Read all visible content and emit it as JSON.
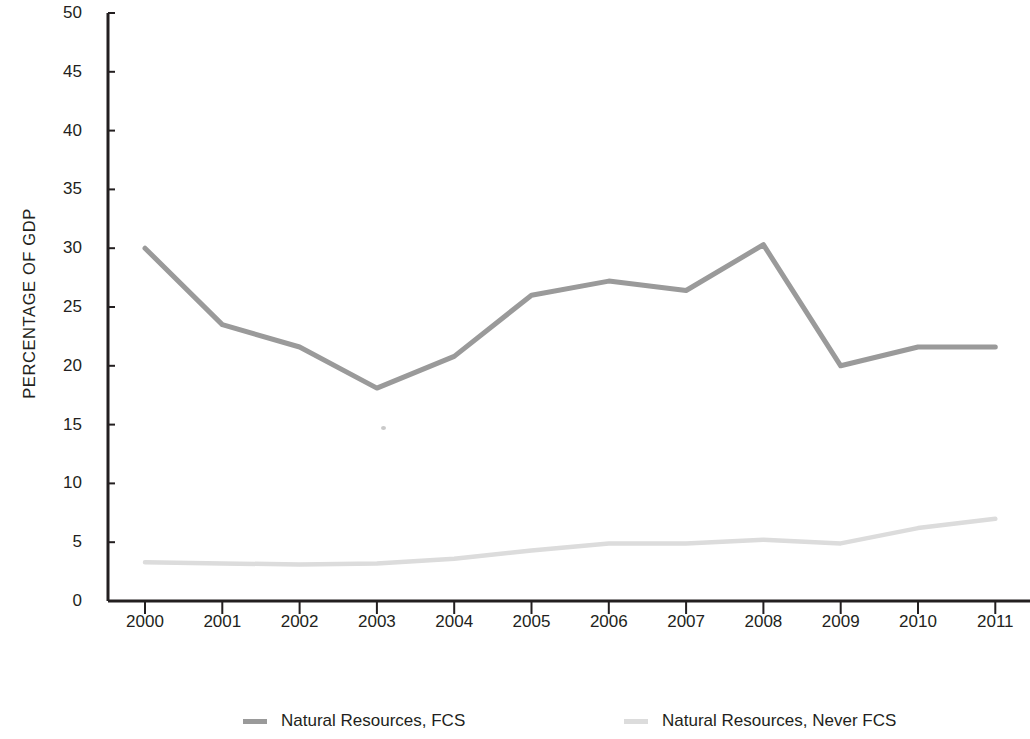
{
  "chart_data": {
    "type": "line",
    "title": "",
    "subtitle": "",
    "xlabel": "",
    "ylabel": "PERCENTAGE OF GDP",
    "categories": [
      "2000",
      "2001",
      "2002",
      "2003",
      "2004",
      "2005",
      "2006",
      "2007",
      "2008",
      "2009",
      "2010",
      "2011"
    ],
    "x": [
      2000,
      2001,
      2002,
      2003,
      2004,
      2005,
      2006,
      2007,
      2008,
      2009,
      2010,
      2011
    ],
    "xlim": [
      2000,
      2011
    ],
    "ylim": [
      0,
      50
    ],
    "y_ticks": [
      0,
      5,
      10,
      15,
      20,
      25,
      30,
      35,
      40,
      45,
      50
    ],
    "y_tick_labels": [
      "0",
      "5",
      "10",
      "15",
      "20",
      "25",
      "30",
      "35",
      "40",
      "45",
      "50"
    ],
    "grid": false,
    "legend_position": "bottom",
    "series": [
      {
        "name": "Natural Resources, FCS",
        "color": "#9a9a9a",
        "values": [
          30.0,
          23.5,
          21.6,
          18.1,
          20.8,
          26.0,
          27.2,
          26.4,
          30.3,
          20.0,
          21.6,
          21.6
        ]
      },
      {
        "name": "Natural Resources, Never FCS",
        "color": "#dcdcdc",
        "values": [
          3.3,
          3.2,
          3.1,
          3.2,
          3.6,
          4.3,
          4.9,
          4.9,
          5.2,
          4.9,
          6.2,
          7.0
        ]
      }
    ]
  },
  "axes": {
    "axis_color": "#231f20",
    "y_axis_title": "PERCENTAGE OF GDP"
  },
  "legend": {
    "entries": [
      {
        "label": "Natural Resources, FCS",
        "color": "#9a9a9a"
      },
      {
        "label": "Natural Resources, Never FCS",
        "color": "#dcdcdc"
      }
    ]
  }
}
